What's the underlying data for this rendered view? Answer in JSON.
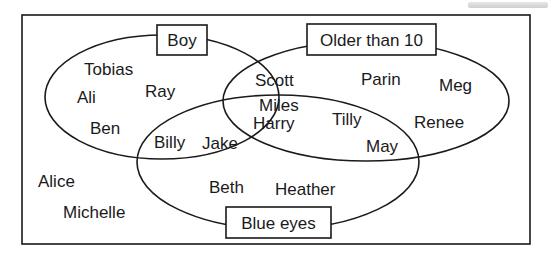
{
  "diagram": {
    "type": "venn",
    "sets": [
      {
        "id": "boy",
        "label": "Boy"
      },
      {
        "id": "older",
        "label": "Older than 10"
      },
      {
        "id": "blue",
        "label": "Blue eyes"
      }
    ],
    "regions": {
      "boy_only": [
        "Tobias",
        "Ali",
        "Ray",
        "Ben"
      ],
      "older_only": [
        "Parin",
        "Meg",
        "Renee"
      ],
      "blue_only": [
        "Beth",
        "Heather"
      ],
      "boy_older": [
        "Scott"
      ],
      "boy_blue": [
        "Billy",
        "Jake"
      ],
      "older_blue": [
        "Tilly",
        "May"
      ],
      "all_three": [
        "Miles",
        "Harry"
      ],
      "none": [
        "Alice",
        "Michelle"
      ]
    },
    "colors": {
      "line": "#1a1a1a",
      "background": "#ffffff"
    }
  },
  "labels": {
    "boy": "Boy",
    "older": "Older than 10",
    "blue": "Blue eyes"
  },
  "names": {
    "tobias": "Tobias",
    "ali": "Ali",
    "ray": "Ray",
    "ben": "Ben",
    "scott": "Scott",
    "miles": "Miles",
    "harry": "Harry",
    "billy": "Billy",
    "jake": "Jake",
    "parin": "Parin",
    "meg": "Meg",
    "tilly": "Tilly",
    "renee": "Renee",
    "may": "May",
    "beth": "Beth",
    "heather": "Heather",
    "alice": "Alice",
    "michelle": "Michelle"
  }
}
